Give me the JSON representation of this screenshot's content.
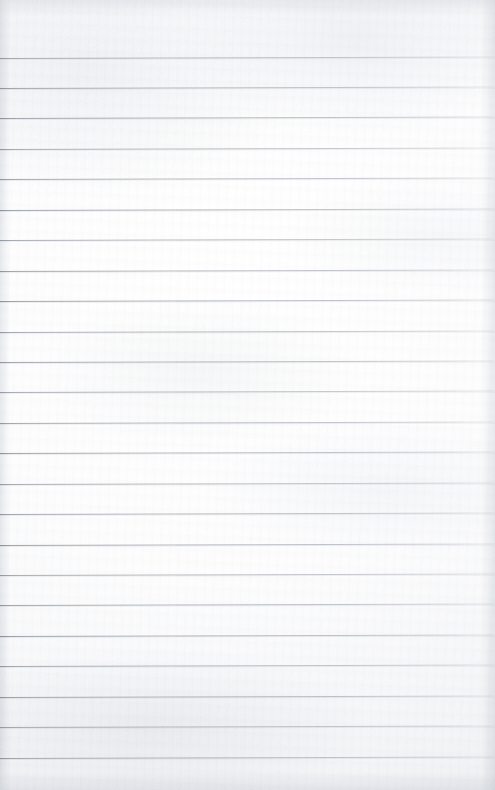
{
  "document": {
    "kind": "scanned-ruled-notepad-page",
    "title": "Blank Ruled Notepad Page",
    "content_text": "",
    "has_handwriting": false,
    "has_printed_text": false,
    "page_width_px": 495,
    "page_height_px": 790
  },
  "paper": {
    "background_color": "#fbfbfc",
    "highlight_color": "#ffffff",
    "shadow_color": "#f2f3f5",
    "edge_tint_color": "#d6dadf",
    "texture": "subtle-scan-grain"
  },
  "rules": {
    "count": 24,
    "line_color": "#8d929a",
    "line_color_faded": "#c4c8ce",
    "thickness_px": 1,
    "first_line_y": 57.5,
    "spacing_px": 30.45,
    "skew_deg": -0.16,
    "left_inset_px": 0,
    "right_inset_px": 0,
    "positions_y": [
      57.5,
      88.0,
      118.4,
      148.8,
      179.3,
      209.7,
      240.2,
      270.6,
      301.0,
      331.5,
      361.9,
      392.4,
      422.8,
      453.2,
      483.7,
      514.1,
      544.6,
      575.0,
      605.4,
      635.9,
      666.3,
      696.8,
      727.2,
      757.6
    ]
  },
  "margins": {
    "top_margin_px": 57,
    "bottom_margin_px": 32,
    "note": "blank margin above first rule and below last rule"
  }
}
